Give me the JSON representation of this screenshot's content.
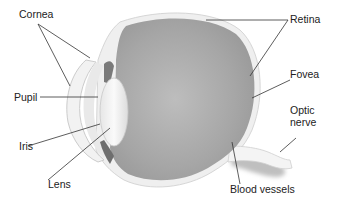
{
  "diagram": {
    "labels": {
      "cornea": "Cornea",
      "pupil": "Pupil",
      "iris": "Iris",
      "lens": "Lens",
      "retina": "Retina",
      "fovea": "Fovea",
      "optic_nerve_line1": "Optic",
      "optic_nerve_line2": "nerve",
      "blood_vessels": "Blood vessels"
    },
    "colors": {
      "background": "#ffffff",
      "vitreous": "#a9a9a9",
      "vitreous_light": "#c4c4c4",
      "sclera": "#ececec",
      "lens": "#f4f4f4",
      "leader_lines": "#333333",
      "text": "#222222"
    }
  }
}
